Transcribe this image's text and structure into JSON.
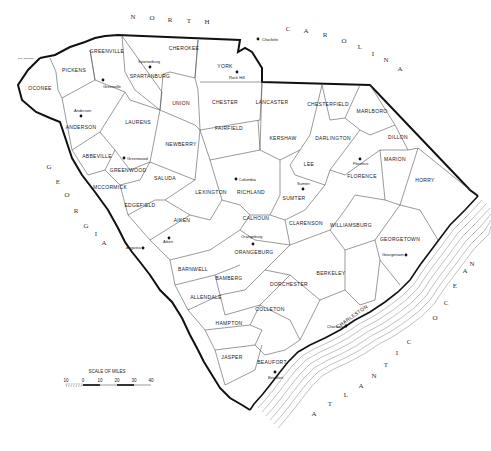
{
  "map": {
    "title": "South Carolina Counties",
    "neighbors": {
      "north": [
        "N",
        "O",
        "R",
        "T",
        "H"
      ],
      "north2": [
        "C",
        "A",
        "R",
        "O",
        "L",
        "I",
        "N",
        "A"
      ],
      "west": [
        "G",
        "E",
        "O",
        "R",
        "G",
        "I",
        "A"
      ],
      "ocean": [
        "A",
        "T",
        "L",
        "A",
        "N",
        "T",
        "I",
        "C"
      ],
      "ocean2": [
        "O",
        "C",
        "E",
        "A",
        "N"
      ]
    },
    "counties": [
      {
        "name": "OCONEE",
        "x": 40,
        "y": 90
      },
      {
        "name": "PICKENS",
        "x": 74,
        "y": 72
      },
      {
        "name": "GREENVILLE",
        "x": 107,
        "y": 53
      },
      {
        "name": "SPARTANBURG",
        "x": 150,
        "y": 78
      },
      {
        "name": "CHEROKEE",
        "x": 184,
        "y": 50
      },
      {
        "name": "YORK",
        "x": 225,
        "y": 68
      },
      {
        "name": "UNION",
        "x": 181,
        "y": 105
      },
      {
        "name": "CHESTER",
        "x": 225,
        "y": 104
      },
      {
        "name": "LANCASTER",
        "x": 272,
        "y": 104
      },
      {
        "name": "CHESTERFIELD",
        "x": 328,
        "y": 106
      },
      {
        "name": "MARLBORO",
        "x": 372,
        "y": 113
      },
      {
        "name": "ANDERSON",
        "x": 81,
        "y": 129
      },
      {
        "name": "LAURENS",
        "x": 138,
        "y": 124
      },
      {
        "name": "FAIRFIELD",
        "x": 229,
        "y": 130
      },
      {
        "name": "KERSHAW",
        "x": 283,
        "y": 140
      },
      {
        "name": "DARLINGTON",
        "x": 333,
        "y": 140
      },
      {
        "name": "DILLON",
        "x": 398,
        "y": 139
      },
      {
        "name": "NEWBERRY",
        "x": 181,
        "y": 146
      },
      {
        "name": "LEE",
        "x": 309,
        "y": 166
      },
      {
        "name": "MARION",
        "x": 395,
        "y": 161
      },
      {
        "name": "ABBEVILLE",
        "x": 97,
        "y": 158
      },
      {
        "name": "GREENWOOD",
        "x": 128,
        "y": 172
      },
      {
        "name": "FLORENCE",
        "x": 362,
        "y": 178
      },
      {
        "name": "HORRY",
        "x": 425,
        "y": 182
      },
      {
        "name": "SALUDA",
        "x": 165,
        "y": 180
      },
      {
        "name": "LEXINGTON",
        "x": 211,
        "y": 194
      },
      {
        "name": "RICHLAND",
        "x": 251,
        "y": 194
      },
      {
        "name": "SUMTER",
        "x": 294,
        "y": 200
      },
      {
        "name": "MCCORMICK",
        "x": 110,
        "y": 189
      },
      {
        "name": "EDGEFIELD",
        "x": 140,
        "y": 207
      },
      {
        "name": "CALHOUN",
        "x": 256,
        "y": 220
      },
      {
        "name": "CLARENSON",
        "x": 306,
        "y": 225
      },
      {
        "name": "WILLIAMSBURG",
        "x": 351,
        "y": 227
      },
      {
        "name": "AIKEN",
        "x": 182,
        "y": 222
      },
      {
        "name": "ORANGEBURG",
        "x": 254,
        "y": 254
      },
      {
        "name": "GEORGETOWN",
        "x": 400,
        "y": 241
      },
      {
        "name": "BERKELEY",
        "x": 331,
        "y": 275
      },
      {
        "name": "BARNWELL",
        "x": 193,
        "y": 271
      },
      {
        "name": "BAMBERG",
        "x": 229,
        "y": 280
      },
      {
        "name": "DORCHESTER",
        "x": 289,
        "y": 286
      },
      {
        "name": "ALLENDALE",
        "x": 206,
        "y": 299
      },
      {
        "name": "COLLETON",
        "x": 270,
        "y": 311
      },
      {
        "name": "HAMPTON",
        "x": 229,
        "y": 325
      },
      {
        "name": "JASPER",
        "x": 232,
        "y": 359
      },
      {
        "name": "BEAUFORT",
        "x": 272,
        "y": 364
      }
    ],
    "cities": [
      {
        "name": "Charlotte",
        "x": 262,
        "y": 40
      },
      {
        "name": "Rock Hill",
        "x": 232,
        "y": 76
      },
      {
        "name": "Spartanburg",
        "x": 145,
        "y": 64
      },
      {
        "name": "Greenville",
        "x": 103,
        "y": 79
      },
      {
        "name": "Anderson",
        "x": 82,
        "y": 116
      },
      {
        "name": "Greenwood",
        "x": 124,
        "y": 158
      },
      {
        "name": "Columbia",
        "x": 238,
        "y": 179
      },
      {
        "name": "Sumter",
        "x": 304,
        "y": 187
      },
      {
        "name": "Florence",
        "x": 360,
        "y": 159
      },
      {
        "name": "Aiken",
        "x": 168,
        "y": 238
      },
      {
        "name": "Augusta",
        "x": 127,
        "y": 248
      },
      {
        "name": "Orangeburg",
        "x": 253,
        "y": 241
      },
      {
        "name": "Georgetown",
        "x": 403,
        "y": 255
      },
      {
        "name": "Charleston",
        "x": 345,
        "y": 325
      },
      {
        "name": "Beaufort",
        "x": 275,
        "y": 374
      }
    ],
    "special_labels": [
      {
        "text": "CHARLESTON",
        "x": 353,
        "y": 318
      },
      {
        "text": "N.C. boundary",
        "x": 28,
        "y": 58
      }
    ],
    "scale": {
      "title": "SCALE OF MILES",
      "ticks": [
        "10",
        "0",
        "10",
        "20",
        "30",
        "40"
      ]
    }
  }
}
